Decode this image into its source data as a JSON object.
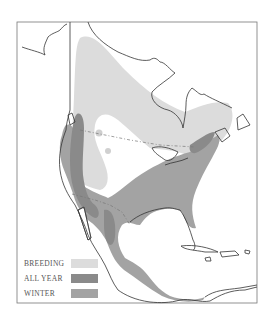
{
  "map": {
    "region": "North America",
    "colors": {
      "breeding": "#dcdcdc",
      "all_year": "#8a8a8a",
      "winter": "#a3a3a3",
      "outline": "#333333",
      "migration_line": "#777777"
    }
  },
  "legend": {
    "items": [
      {
        "label": "BREEDING",
        "color": "#dcdcdc"
      },
      {
        "label": "ALL YEAR",
        "color": "#8a8a8a"
      },
      {
        "label": "WINTER",
        "color": "#a3a3a3"
      }
    ]
  }
}
